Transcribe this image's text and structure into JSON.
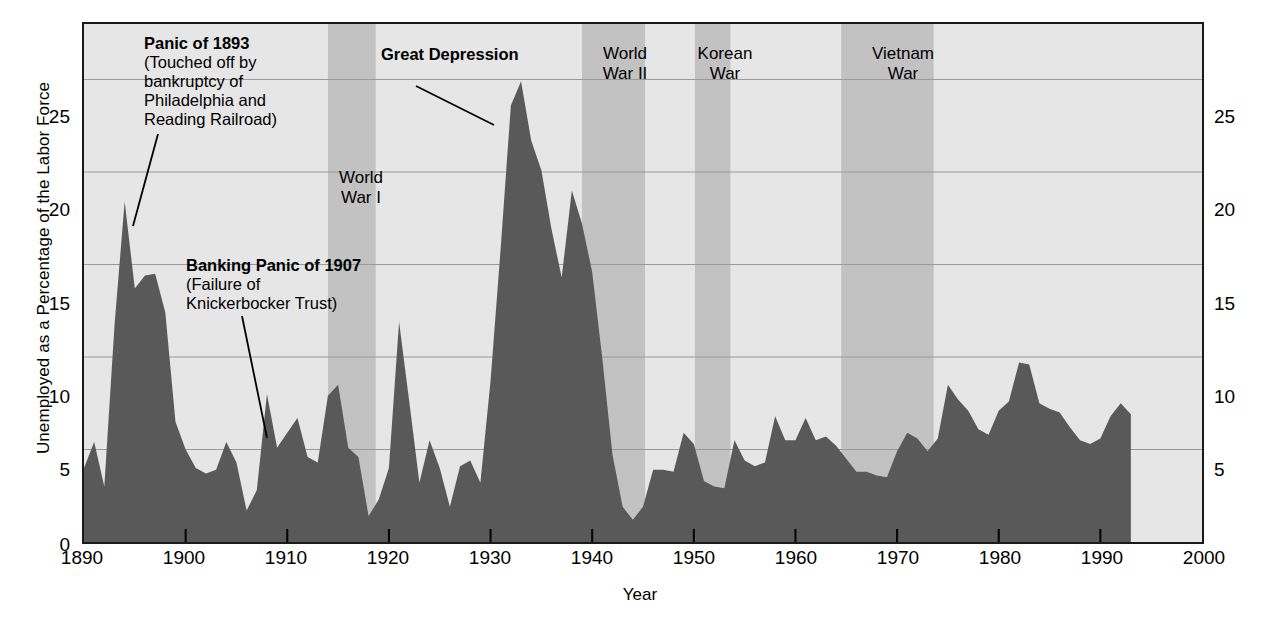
{
  "chart_data": {
    "type": "area",
    "title": "",
    "xlabel": "Year",
    "ylabel": "Unemployed as a Percentage of the Labor Force",
    "xlim": [
      1890,
      2000
    ],
    "ylim": [
      0,
      28
    ],
    "grid": true,
    "legend": "none",
    "series_name": "Unemployment rate",
    "series_color": "#595959",
    "plot_background": "#e6e6e6",
    "band_color": "#c2c2c2",
    "xticks": [
      "1890",
      "1900",
      "1910",
      "1920",
      "1930",
      "1940",
      "1950",
      "1960",
      "1970",
      "1980",
      "1990",
      "2000"
    ],
    "yticks_left": [
      "0",
      "5",
      "10",
      "15",
      "20",
      "25"
    ],
    "yticks_right": [
      "5",
      "10",
      "15",
      "20",
      "25"
    ],
    "x": [
      1890,
      1891,
      1892,
      1893,
      1894,
      1895,
      1896,
      1897,
      1898,
      1899,
      1900,
      1901,
      1902,
      1903,
      1904,
      1905,
      1906,
      1907,
      1908,
      1909,
      1910,
      1911,
      1912,
      1913,
      1914,
      1915,
      1916,
      1917,
      1918,
      1919,
      1920,
      1921,
      1922,
      1923,
      1924,
      1925,
      1926,
      1927,
      1928,
      1929,
      1930,
      1931,
      1932,
      1933,
      1934,
      1935,
      1936,
      1937,
      1938,
      1939,
      1940,
      1941,
      1942,
      1943,
      1944,
      1945,
      1946,
      1947,
      1948,
      1949,
      1950,
      1951,
      1952,
      1953,
      1954,
      1955,
      1956,
      1957,
      1958,
      1959,
      1960,
      1961,
      1962,
      1963,
      1964,
      1965,
      1966,
      1967,
      1968,
      1969,
      1970,
      1971,
      1972,
      1973,
      1974,
      1975,
      1976,
      1977,
      1978,
      1979,
      1980,
      1981,
      1982,
      1983,
      1984,
      1985,
      1986,
      1987,
      1988,
      1989,
      1990,
      1991,
      1992,
      1993
    ],
    "values": [
      4.0,
      5.4,
      3.0,
      11.7,
      18.4,
      13.7,
      14.4,
      14.5,
      12.4,
      6.5,
      5.0,
      4.0,
      3.7,
      3.9,
      5.4,
      4.3,
      1.7,
      2.8,
      8.0,
      5.1,
      5.9,
      6.7,
      4.6,
      4.3,
      7.9,
      8.5,
      5.1,
      4.6,
      1.4,
      2.3,
      4.0,
      11.9,
      7.6,
      3.2,
      5.5,
      4.0,
      1.9,
      4.1,
      4.4,
      3.2,
      8.7,
      15.9,
      23.6,
      24.9,
      21.7,
      20.1,
      16.9,
      14.3,
      19.0,
      17.2,
      14.6,
      9.9,
      4.7,
      1.9,
      1.2,
      1.9,
      3.9,
      3.9,
      3.8,
      5.9,
      5.3,
      3.3,
      3.0,
      2.9,
      5.5,
      4.4,
      4.1,
      4.3,
      6.8,
      5.5,
      5.5,
      6.7,
      5.5,
      5.7,
      5.2,
      4.5,
      3.8,
      3.8,
      3.6,
      3.5,
      4.9,
      5.9,
      5.6,
      4.9,
      5.6,
      8.5,
      7.7,
      7.1,
      6.1,
      5.8,
      7.1,
      7.6,
      9.7,
      9.6,
      7.5,
      7.2,
      7.0,
      6.2,
      5.5,
      5.3,
      5.6,
      6.8,
      7.5,
      6.9
    ]
  },
  "bands": [
    {
      "name": "World War I",
      "label_line1": "World",
      "label_line2": "War I",
      "start": 1914.0,
      "end": 1918.7
    },
    {
      "name": "World War II",
      "label_line1": "World",
      "label_line2": "War II",
      "start": 1939.0,
      "end": 1945.2
    },
    {
      "name": "Korean War",
      "label_line1": "Korean",
      "label_line2": "War",
      "start": 1950.1,
      "end": 1953.6
    },
    {
      "name": "Vietnam War",
      "label_line1": "Vietnam",
      "label_line2": "War",
      "start": 1964.5,
      "end": 1973.6
    }
  ],
  "annotations": [
    {
      "id": "panic-1893",
      "title": "Panic of 1893",
      "lines": [
        "(Touched off by",
        "bankruptcy of",
        "Philadelphia and",
        "Reading Railroad)"
      ]
    },
    {
      "id": "banking-panic-1907",
      "title": "Banking Panic of 1907",
      "lines": [
        "(Failure of",
        "Knickerbocker Trust)"
      ]
    },
    {
      "id": "great-depression",
      "title": "Great Depression",
      "lines": []
    }
  ]
}
